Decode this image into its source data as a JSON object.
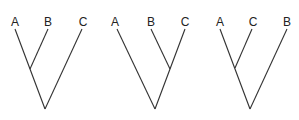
{
  "diagram": {
    "type": "phylogenetic-trees",
    "trees": [
      {
        "labels": [
          "A",
          "B",
          "C"
        ],
        "tips": [
          [
            15,
            29
          ],
          [
            48,
            29
          ],
          [
            82,
            29
          ]
        ],
        "label_x": [
          15,
          48,
          83
        ],
        "inner": [
          30,
          69
        ],
        "root": [
          45,
          109
        ],
        "grouping": "((A,B),C)"
      },
      {
        "labels": [
          "A",
          "B",
          "C"
        ],
        "tips": [
          [
            115,
            29
          ],
          [
            151,
            29
          ],
          [
            185,
            29
          ]
        ],
        "label_x": [
          115,
          151,
          185
        ],
        "inner": [
          170,
          69
        ],
        "root": [
          155,
          109
        ],
        "grouping": "(A,(B,C))"
      },
      {
        "labels": [
          "A",
          "C",
          "B"
        ],
        "tips": [
          [
            220,
            29
          ],
          [
            253,
            29
          ],
          [
            287,
            29
          ]
        ],
        "label_x": [
          220,
          253,
          287
        ],
        "inner": [
          235,
          68
        ],
        "root": [
          250,
          109
        ],
        "grouping": "((A,C),B)"
      }
    ]
  }
}
